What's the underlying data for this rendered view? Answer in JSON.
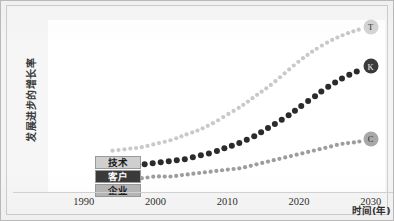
{
  "chart_data": {
    "type": "line",
    "title": "",
    "subtitle": "",
    "xlabel": "时间(年)",
    "ylabel": "发展进步的增长率",
    "xlim": [
      1985,
      2032
    ],
    "ylim": [
      0,
      100
    ],
    "xticks": [
      1990,
      2000,
      2010,
      2020,
      2030
    ],
    "xtick_labels": [
      "1990",
      "2000",
      "2010",
      "2020",
      "2030"
    ],
    "yticks": [],
    "ytick_labels": [],
    "grid": false,
    "legend_position": "inside-bottom-left",
    "line_style": "dotted",
    "series": [
      {
        "name": "技术",
        "marker_letter": "T",
        "color": "#c9c9c9",
        "legend_fill": "#cfcfcf",
        "legend_text_color": "#1a1a1a",
        "dot_size": 2.1,
        "x": [
          1994,
          1996,
          1998,
          2000,
          2002,
          2004,
          2006,
          2008,
          2010,
          2012,
          2014,
          2016,
          2018,
          2020,
          2022,
          2024,
          2026,
          2028,
          2029
        ],
        "y": [
          24,
          25,
          26,
          28,
          30,
          33,
          36,
          40,
          45,
          50,
          56,
          62,
          69,
          76,
          82,
          87,
          91,
          94,
          95
        ]
      },
      {
        "name": "客户",
        "marker_letter": "K",
        "color": "#2b2b2b",
        "legend_fill": "#3a3a3a",
        "legend_text_color": "#ffffff",
        "dot_size": 3.0,
        "x": [
          1994,
          1996,
          1998,
          2000,
          2002,
          2004,
          2006,
          2008,
          2010,
          2012,
          2014,
          2016,
          2018,
          2020,
          2022,
          2024,
          2026,
          2028,
          2029
        ],
        "y": [
          16,
          16,
          16,
          17,
          18,
          19,
          21,
          23,
          26,
          29,
          33,
          38,
          43,
          49,
          55,
          61,
          66,
          70,
          72
        ]
      },
      {
        "name": "企业",
        "marker_letter": "C",
        "color": "#9d9d9d",
        "legend_fill": "#b5b5b5",
        "legend_text_color": "#1a1a1a",
        "dot_size": 2.1,
        "x": [
          1994,
          1996,
          1998,
          2000,
          2002,
          2004,
          2006,
          2008,
          2010,
          2012,
          2014,
          2016,
          2018,
          2020,
          2022,
          2024,
          2026,
          2028,
          2029
        ],
        "y": [
          8,
          8,
          8,
          9,
          9,
          10,
          11,
          12,
          13,
          14,
          16,
          18,
          20,
          22,
          24,
          26,
          28,
          29,
          30
        ]
      }
    ],
    "endpoint_markers": [
      {
        "letter": "T",
        "fill": "#d4d4d4",
        "text_color": "#333333",
        "x": 2030,
        "y": 96
      },
      {
        "letter": "K",
        "fill": "#3b3b3b",
        "text_color": "#f0f0f0",
        "x": 2030,
        "y": 73
      },
      {
        "letter": "C",
        "fill": "#a8a8a8",
        "text_color": "#2c2c2c",
        "x": 2030,
        "y": 31
      }
    ]
  },
  "legend": {
    "items": [
      {
        "label": "技术"
      },
      {
        "label": "客户"
      },
      {
        "label": "企业"
      }
    ]
  },
  "axes": {
    "x_title": "时间(年)",
    "y_title": "发展进步的增长率"
  }
}
